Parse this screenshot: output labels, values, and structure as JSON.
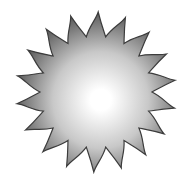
{
  "image": {
    "subject": "sun-burst-icon",
    "width": 187,
    "height": 182,
    "background": "#ffffff"
  },
  "sun": {
    "center_x": 96,
    "center_y": 92,
    "outer_radius": 80,
    "inner_radius": 56,
    "ray_count": 18,
    "colors": {
      "center": "#ffffff",
      "mid": "#c8c8c8",
      "edge": "#5a5a5a",
      "outline": "#3c3c3c"
    }
  }
}
